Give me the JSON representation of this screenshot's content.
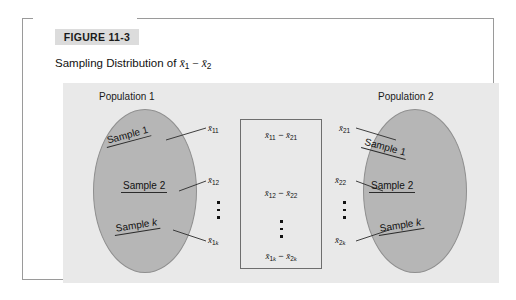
{
  "figure": {
    "badge_label": "FIGURE 11-3",
    "title_prefix": "Sampling Distribution of ",
    "title_math": "x̄1 − x̄2"
  },
  "colors": {
    "panel_background": "#e9e9e9",
    "ellipse_fill": "#b6b6b6",
    "ellipse_stroke": "#8f8f8f",
    "frame_border": "#9a9a9a",
    "badge_background": "#dcdcdc",
    "box_border": "#6e6e6e",
    "text": "#111111"
  },
  "populations": [
    {
      "id": "population-1",
      "label": "Population 1",
      "samples": [
        {
          "name": "Sample 1",
          "mean": "x̄11"
        },
        {
          "name": "Sample 2",
          "mean": "x̄12"
        },
        {
          "name": "Sample k",
          "mean": "x̄1k"
        }
      ]
    },
    {
      "id": "population-2",
      "label": "Population 2",
      "samples": [
        {
          "name": "Sample 1",
          "mean": "x̄21"
        },
        {
          "name": "Sample 2",
          "mean": "x̄22"
        },
        {
          "name": "Sample k",
          "mean": "x̄2k"
        }
      ]
    }
  ],
  "difference_box": {
    "rows": [
      "x̄11 − x̄21",
      "x̄12 − x̄22",
      "x̄1k − x̄2k"
    ],
    "ellipsis": "⋮"
  }
}
